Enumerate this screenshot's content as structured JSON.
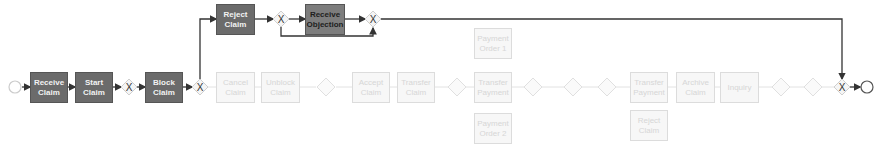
{
  "diagram": {
    "type": "BPMN process model",
    "colors": {
      "active_task": "#6b6b6b",
      "active_task_alt": "#7d7d7d",
      "faded_task": "#f7f7f7",
      "flow": "#333333",
      "faded_flow": "#dddddd"
    },
    "active_tasks": [
      {
        "id": "receive-claim",
        "label": "Receive Claim"
      },
      {
        "id": "start-claim",
        "label": "Start Claim"
      },
      {
        "id": "block-claim",
        "label": "Block Claim"
      },
      {
        "id": "reject-claim",
        "label": "Reject Claim"
      },
      {
        "id": "receive-objection",
        "label": "Receive Objection"
      }
    ],
    "faded_tasks": [
      {
        "id": "f1",
        "label": "Cancel Claim"
      },
      {
        "id": "f2",
        "label": "Unblock Claim"
      },
      {
        "id": "f3",
        "label": "Accept Claim"
      },
      {
        "id": "f4",
        "label": "Transfer Claim"
      },
      {
        "id": "f5",
        "label": "Payment Order 1"
      },
      {
        "id": "f6",
        "label": "Transfer Payment"
      },
      {
        "id": "f7",
        "label": "Payment Order 2"
      },
      {
        "id": "f8",
        "label": "Transfer Payment"
      },
      {
        "id": "f9",
        "label": "Archive Claim"
      },
      {
        "id": "f10",
        "label": "Inquiry"
      },
      {
        "id": "f11",
        "label": "Reject Claim"
      }
    ],
    "gateway_symbol": "X",
    "events": {
      "start": "start-event",
      "end": "end-event"
    }
  }
}
